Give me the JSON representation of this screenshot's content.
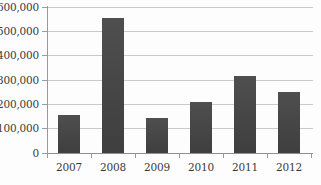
{
  "chart_data": {
    "type": "bar",
    "title": "",
    "subtitle": "",
    "xlabel": "",
    "ylabel": "",
    "categories": [
      "2007",
      "2008",
      "2009",
      "2010",
      "2011",
      "2012"
    ],
    "values": [
      157000,
      557000,
      143000,
      210000,
      318000,
      251000
    ],
    "series": [
      {
        "name": "",
        "values": [
          157000,
          557000,
          143000,
          210000,
          318000,
          251000
        ]
      }
    ],
    "ylim": [
      0,
      600000
    ],
    "ytick_values": [
      0,
      100000,
      200000,
      300000,
      400000,
      500000,
      600000
    ],
    "ytick_labels": [
      "0",
      "100,000",
      "200,000",
      "300,000",
      "400,000",
      "500,000",
      "600,000"
    ],
    "xtick_labels": [
      "2007",
      "2008",
      "2009",
      "2010",
      "2011",
      "2012"
    ],
    "grid": true,
    "grid_axis": "y",
    "legend": false,
    "legend_position": "none",
    "annotations": [],
    "colors": {
      "bar": "#474747",
      "gridline": "#c9c9c9",
      "axis": "#9a9a9a",
      "baseline": "#8f8f8f",
      "text": "#3a3a3a",
      "background": "#fdfdfd"
    }
  }
}
